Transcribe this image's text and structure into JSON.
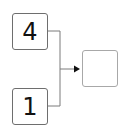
{
  "diagram": {
    "inputs": [
      {
        "label": "4"
      },
      {
        "label": "1"
      }
    ],
    "output": {
      "label": ""
    },
    "colors": {
      "box_border": "#6e6e6e",
      "answer_border": "#a8a8a8",
      "wire": "#7a7a7a",
      "arrow": "#111111"
    }
  }
}
